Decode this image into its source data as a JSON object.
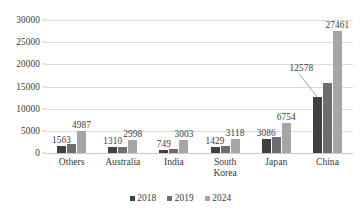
{
  "chart_data": {
    "type": "bar",
    "title": "",
    "subtitle": "",
    "xlabel": "",
    "ylabel": "",
    "ylim": [
      0,
      30000
    ],
    "ytick_labels": [
      "0",
      "5000",
      "10000",
      "15000",
      "20000",
      "25000",
      "30000"
    ],
    "ytick_values": [
      0,
      5000,
      10000,
      15000,
      20000,
      25000,
      30000
    ],
    "grid": true,
    "legend_position": "bottom",
    "categories": [
      "Others",
      "Australia",
      "India",
      "South\nKorea",
      "Japan",
      "China"
    ],
    "series": [
      {
        "name": "2018",
        "color": "#404040",
        "values": [
          1563,
          1310,
          749,
          1429,
          3086,
          12578
        ]
      },
      {
        "name": "2019",
        "color": "#6e6e6e",
        "values": [
          2100,
          1450,
          980,
          1520,
          3500,
          15900
        ]
      },
      {
        "name": "2024",
        "color": "#a6a6a6",
        "values": [
          4987,
          2998,
          3003,
          3118,
          6754,
          27461
        ]
      }
    ],
    "data_labels": [
      {
        "text": "1563",
        "category": "Others",
        "series": "2018",
        "value": 1563
      },
      {
        "text": "4987",
        "category": "Others",
        "series": "2024",
        "value": 4987
      },
      {
        "text": "1310",
        "category": "Australia",
        "series": "2018",
        "value": 1310
      },
      {
        "text": "2998",
        "category": "Australia",
        "series": "2024",
        "value": 2998
      },
      {
        "text": "749",
        "category": "India",
        "series": "2018",
        "value": 749
      },
      {
        "text": "3003",
        "category": "India",
        "series": "2024",
        "value": 3003
      },
      {
        "text": "1429",
        "category": "South Korea",
        "series": "2018",
        "value": 1429
      },
      {
        "text": "3118",
        "category": "South Korea",
        "series": "2024",
        "value": 3118
      },
      {
        "text": "3086",
        "category": "Japan",
        "series": "2018",
        "value": 3086
      },
      {
        "text": "6754",
        "category": "Japan",
        "series": "2024",
        "value": 6754
      },
      {
        "text": "12578",
        "category": "China",
        "series": "2018",
        "value": 12578,
        "leader_line": true
      },
      {
        "text": "27461",
        "category": "China",
        "series": "2024",
        "value": 27461
      }
    ],
    "colors": {
      "series_2018": "#404040",
      "series_2019": "#6e6e6e",
      "series_2024": "#a6a6a6",
      "gridline": "#dcdcdc",
      "axis": "#c9c9c9",
      "text": "#3a3a3a",
      "background": "#ffffff"
    }
  }
}
